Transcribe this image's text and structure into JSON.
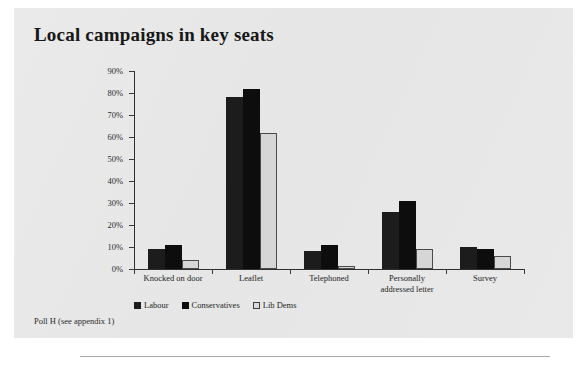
{
  "page": {
    "title": "Local campaigns in key seats",
    "footnote": "Poll H (see appendix 1)"
  },
  "colors": {
    "labour": "#1c1c1c",
    "conservatives": "#0d0d0d",
    "libdems": "#d6d6d6",
    "sheet_background": "#e8e8e8",
    "axis": "#2f2f2f"
  },
  "chart_data": {
    "type": "bar",
    "title": "Local campaigns in key seats",
    "xlabel": "",
    "ylabel": "",
    "ylim": [
      0,
      90
    ],
    "ytick_labels": [
      "90%",
      "80%",
      "70%",
      "60%",
      "50%",
      "40%",
      "30%",
      "20%",
      "10%",
      "0%"
    ],
    "ytick_values": [
      90,
      80,
      70,
      60,
      50,
      40,
      30,
      20,
      10,
      0
    ],
    "grid": false,
    "legend_position": "bottom-left",
    "categories": [
      "Knocked on door",
      "Leaflet",
      "Telephoned",
      "Personally addressed  letter",
      "Survey"
    ],
    "category_lines": [
      [
        "Knocked on door"
      ],
      [
        "Leaflet"
      ],
      [
        "Telephoned"
      ],
      [
        "Personally",
        "addressed  letter"
      ],
      [
        "Survey"
      ]
    ],
    "series": [
      {
        "name": "Labour",
        "values": [
          9,
          78,
          8,
          26,
          10
        ]
      },
      {
        "name": "Conservatives",
        "values": [
          11,
          82,
          11,
          31,
          9
        ]
      },
      {
        "name": "Lib Dems",
        "values": [
          4,
          62,
          1.5,
          9,
          6
        ]
      }
    ]
  },
  "legend": {
    "items": [
      {
        "label": "Labour"
      },
      {
        "label": "Conservatives"
      },
      {
        "label": "Lib Dems"
      }
    ]
  }
}
